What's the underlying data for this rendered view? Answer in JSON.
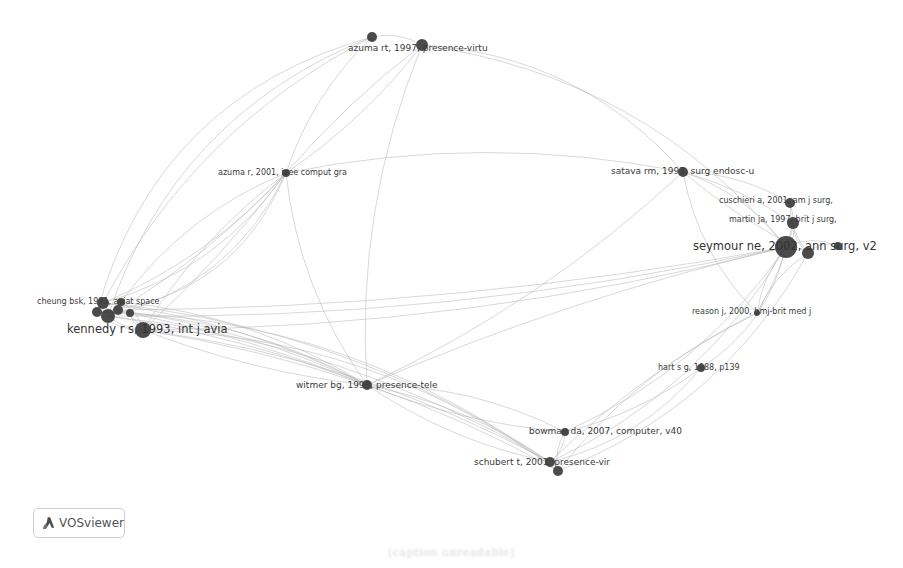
{
  "app": {
    "name": "VOSviewer",
    "badge_label": "VOSviewer",
    "badge_icon": "vosviewer-logo-icon"
  },
  "caption": "[caption unreadable]",
  "colors": {
    "node": "#3c3c3c",
    "edge": "#b5b5b5",
    "label": "#3a3a3a",
    "background": "#ffffff"
  },
  "network": {
    "type": "co-citation network",
    "nodes": [
      {
        "id": "n0",
        "label": "azuma rt, 1997, presence-virtu",
        "x": 422,
        "y": 45,
        "r": 6,
        "size": "m"
      },
      {
        "id": "n1",
        "label": "",
        "x": 372,
        "y": 37,
        "r": 5,
        "size": "m"
      },
      {
        "id": "n2",
        "label": "azuma r, 2001, ieee comput gra",
        "x": 286,
        "y": 173,
        "r": 4,
        "size": "s"
      },
      {
        "id": "n3",
        "label": "satava rm, 1993, surg endosc-u",
        "x": 683,
        "y": 172,
        "r": 5,
        "size": "m"
      },
      {
        "id": "n4",
        "label": "cuschieri a, 2001, am j surg,",
        "x": 790,
        "y": 203,
        "r": 5,
        "size": "s"
      },
      {
        "id": "n5",
        "label": "martin ja, 1997, brit j surg,",
        "x": 793,
        "y": 223,
        "r": 6,
        "size": "s"
      },
      {
        "id": "n6",
        "label": "seymour ne, 2002, ann surg, v2",
        "x": 786,
        "y": 247,
        "r": 11,
        "size": "l"
      },
      {
        "id": "n7",
        "label": "",
        "x": 808,
        "y": 253,
        "r": 6,
        "size": "m"
      },
      {
        "id": "n8",
        "label": "",
        "x": 838,
        "y": 246,
        "r": 4,
        "size": "m"
      },
      {
        "id": "n9",
        "label": "reason j, 2000, bmj-brit med j",
        "x": 757,
        "y": 313,
        "r": 3,
        "size": "s"
      },
      {
        "id": "n10",
        "label": "hart s g, 1988, p139",
        "x": 701,
        "y": 368,
        "r": 4,
        "size": "s"
      },
      {
        "id": "n11",
        "label": "cheung bsk, 1991, aviat space",
        "x": 103,
        "y": 303,
        "r": 6,
        "size": "s"
      },
      {
        "id": "n12",
        "label": "",
        "x": 108,
        "y": 316,
        "r": 7,
        "size": "s"
      },
      {
        "id": "n13",
        "label": "",
        "x": 97,
        "y": 312,
        "r": 5,
        "size": "s"
      },
      {
        "id": "n14",
        "label": "",
        "x": 118,
        "y": 310,
        "r": 5,
        "size": "s"
      },
      {
        "id": "n15",
        "label": "",
        "x": 121,
        "y": 302,
        "r": 4,
        "size": "s"
      },
      {
        "id": "n16",
        "label": "",
        "x": 130,
        "y": 313,
        "r": 4,
        "size": "s"
      },
      {
        "id": "n17",
        "label": "kennedy r s, 1993, int j avia",
        "x": 143,
        "y": 330,
        "r": 8,
        "size": "l"
      },
      {
        "id": "n18",
        "label": "witmer bg, 1998, presence-tele",
        "x": 367,
        "y": 385,
        "r": 5,
        "size": "m"
      },
      {
        "id": "n19",
        "label": "bowman da, 2007, computer, v40",
        "x": 565,
        "y": 432,
        "r": 4,
        "size": "m"
      },
      {
        "id": "n20",
        "label": "schubert t, 2001, presence-vir",
        "x": 550,
        "y": 462,
        "r": 5,
        "size": "m"
      },
      {
        "id": "n21",
        "label": "",
        "x": 558,
        "y": 471,
        "r": 5,
        "size": "m"
      }
    ],
    "labels": [
      {
        "node": "n0",
        "text": "azuma rt, 1997, presence-virtu",
        "x": 348,
        "y": 44,
        "size": "m"
      },
      {
        "node": "n2",
        "text": "azuma r, 2001, ieee comput gra",
        "x": 218,
        "y": 169,
        "size": "s"
      },
      {
        "node": "n3",
        "text": "satava rm, 1993, surg endosc-u",
        "x": 611,
        "y": 167,
        "size": "m"
      },
      {
        "node": "n4",
        "text": "cuschieri a, 2001, am j surg,",
        "x": 719,
        "y": 197,
        "size": "s"
      },
      {
        "node": "n5",
        "text": "martin ja, 1997, brit j surg,",
        "x": 729,
        "y": 216,
        "size": "s"
      },
      {
        "node": "n6",
        "text": "seymour ne, 2002, ann surg, v2",
        "x": 693,
        "y": 241,
        "size": "l"
      },
      {
        "node": "n9",
        "text": "reason j, 2000, bmj-brit med j",
        "x": 692,
        "y": 308,
        "size": "s"
      },
      {
        "node": "n10",
        "text": "hart s g, 1988, p139",
        "x": 658,
        "y": 364,
        "size": "s"
      },
      {
        "node": "n11",
        "text": "cheung bsk, 1991, aviat space",
        "x": 37,
        "y": 298,
        "size": "s"
      },
      {
        "node": "n17",
        "text": "kennedy r s, 1993, int j avia",
        "x": 67,
        "y": 324,
        "size": "l"
      },
      {
        "node": "n18",
        "text": "witmer bg, 1998, presence-tele",
        "x": 296,
        "y": 381,
        "size": "m"
      },
      {
        "node": "n19",
        "text": "bowman da, 2007, computer, v40",
        "x": 529,
        "y": 427,
        "size": "m"
      },
      {
        "node": "n20",
        "text": "schubert t, 2001, presence-vir",
        "x": 474,
        "y": 458,
        "size": "m"
      }
    ],
    "edges": [
      [
        "n2",
        "n11",
        -40
      ],
      [
        "n2",
        "n11",
        -25
      ],
      [
        "n2",
        "n12",
        -55
      ],
      [
        "n2",
        "n13",
        -70
      ],
      [
        "n2",
        "n14",
        -15
      ],
      [
        "n2",
        "n17",
        -10
      ],
      [
        "n2",
        "n17",
        20
      ],
      [
        "n2",
        "n15",
        30
      ],
      [
        "n2",
        "n1",
        -20
      ],
      [
        "n2",
        "n0",
        -10
      ],
      [
        "n2",
        "n0",
        15
      ],
      [
        "n2",
        "n18",
        30
      ],
      [
        "n2",
        "n3",
        -40
      ],
      [
        "n1",
        "n0",
        -10
      ],
      [
        "n1",
        "n11",
        60
      ],
      [
        "n1",
        "n12",
        90
      ],
      [
        "n1",
        "n13",
        110
      ],
      [
        "n0",
        "n3",
        -60
      ],
      [
        "n0",
        "n6",
        -80
      ],
      [
        "n0",
        "n18",
        40
      ],
      [
        "n3",
        "n6",
        -20
      ],
      [
        "n3",
        "n5",
        -10
      ],
      [
        "n3",
        "n4",
        -15
      ],
      [
        "n3",
        "n7",
        10
      ],
      [
        "n3",
        "n18",
        -30
      ],
      [
        "n3",
        "n9",
        25
      ],
      [
        "n4",
        "n6",
        -10
      ],
      [
        "n4",
        "n7",
        10
      ],
      [
        "n5",
        "n6",
        -8
      ],
      [
        "n5",
        "n7",
        8
      ],
      [
        "n6",
        "n8",
        -12
      ],
      [
        "n7",
        "n8",
        -10
      ],
      [
        "n6",
        "n9",
        10
      ],
      [
        "n5",
        "n9",
        -8
      ],
      [
        "n7",
        "n9",
        12
      ],
      [
        "n6",
        "n10",
        -30
      ],
      [
        "n6",
        "n20",
        -50
      ],
      [
        "n6",
        "n19",
        -40
      ],
      [
        "n7",
        "n21",
        -60
      ],
      [
        "n6",
        "n17",
        -40
      ],
      [
        "n6",
        "n18",
        20
      ],
      [
        "n11",
        "n18",
        -25
      ],
      [
        "n12",
        "n18",
        -15
      ],
      [
        "n13",
        "n18",
        -35
      ],
      [
        "n14",
        "n18",
        -20
      ],
      [
        "n17",
        "n18",
        -10
      ],
      [
        "n17",
        "n18",
        15
      ],
      [
        "n15",
        "n18",
        -30
      ],
      [
        "n16",
        "n18",
        -12
      ],
      [
        "n11",
        "n20",
        -60
      ],
      [
        "n12",
        "n20",
        -50
      ],
      [
        "n17",
        "n20",
        -40
      ],
      [
        "n17",
        "n21",
        -70
      ],
      [
        "n13",
        "n21",
        -80
      ],
      [
        "n11",
        "n12",
        5
      ],
      [
        "n11",
        "n14",
        8
      ],
      [
        "n12",
        "n17",
        6
      ],
      [
        "n14",
        "n17",
        -6
      ],
      [
        "n13",
        "n17",
        10
      ],
      [
        "n15",
        "n17",
        -8
      ],
      [
        "n16",
        "n17",
        5
      ],
      [
        "n18",
        "n20",
        -20
      ],
      [
        "n18",
        "n20",
        20
      ],
      [
        "n18",
        "n21",
        -10
      ],
      [
        "n18",
        "n19",
        -25
      ],
      [
        "n18",
        "n19",
        15
      ],
      [
        "n19",
        "n20",
        -8
      ],
      [
        "n19",
        "n21",
        8
      ],
      [
        "n10",
        "n20",
        -30
      ],
      [
        "n10",
        "n19",
        -15
      ],
      [
        "n9",
        "n21",
        30
      ],
      [
        "n9",
        "n20",
        20
      ],
      [
        "n12",
        "n6",
        40
      ],
      [
        "n14",
        "n6",
        30
      ]
    ]
  }
}
